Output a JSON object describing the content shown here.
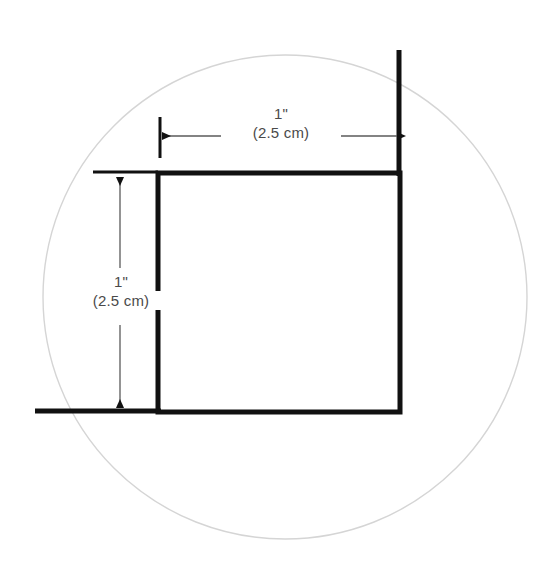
{
  "figure": {
    "background_color": "#ffffff"
  },
  "shapes": {
    "circle": {
      "name": "reference-circle",
      "center_x": 285,
      "center_y": 297,
      "radius": 242,
      "stroke_color": "#d5d5d5",
      "stroke_width": 1.4,
      "fill": "none"
    },
    "square": {
      "name": "square-outline",
      "x": 158,
      "y": 173,
      "width": 242,
      "height": 239,
      "stroke_color": "#111111",
      "stroke_width": 5,
      "fill": "none"
    },
    "right_vertical_extension": {
      "name": "right-vertical-line",
      "x": 399,
      "y_top": 50,
      "y_bottom": 173,
      "stroke_color": "#111111",
      "stroke_width": 5
    },
    "bottom_horizontal_extension": {
      "name": "bottom-horizontal-line",
      "y": 411,
      "x_left": 35,
      "x_right": 158,
      "stroke_color": "#111111",
      "stroke_width": 5
    }
  },
  "dimensions": {
    "horizontal": {
      "name": "width-dimension",
      "value_imperial": "1\"",
      "value_metric": "(2.5 cm)",
      "line_y": 136,
      "x_start": 161,
      "x_end": 398,
      "extension_tick": {
        "x": 160,
        "y_top": 117,
        "y_bottom": 158
      },
      "stroke_color": "#5a5a5a",
      "stroke_width": 1.3,
      "arrow_color": "#111111"
    },
    "vertical": {
      "name": "height-dimension",
      "value_imperial": "1\"",
      "value_metric": "(2.5 cm)",
      "line_x": 120,
      "y_start": 176,
      "y_end": 409,
      "extension_tick": {
        "y": 172,
        "x_left": 93,
        "x_right": 158
      },
      "stroke_color": "#5a5a5a",
      "stroke_width": 1.3,
      "arrow_color": "#111111"
    }
  },
  "colors": {
    "ink": "#111111",
    "dimension_line": "#5a5a5a",
    "label_text": "#4a4a4a",
    "circle_guide": "#d5d5d5",
    "background": "#ffffff"
  }
}
